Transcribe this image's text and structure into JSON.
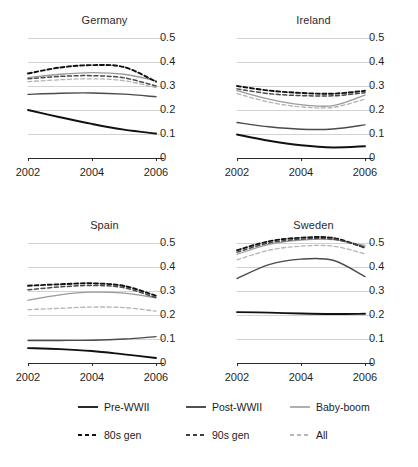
{
  "chart_data": {
    "type": "line",
    "title": "",
    "layout": {
      "rows": 2,
      "cols": 2,
      "shared_axes": true,
      "grid": true,
      "y_axis_side": "right",
      "legend_position": "bottom"
    },
    "x": [
      2002,
      2003,
      2004,
      2005,
      2006
    ],
    "xlabel": "",
    "ylabel": "",
    "xlim": [
      2002,
      2006
    ],
    "ylim": [
      0,
      0.5
    ],
    "xticks": [
      "2002",
      "2004",
      "2006"
    ],
    "xtick_values": [
      2002,
      2004,
      2006
    ],
    "yticks": [
      "0",
      "0.1",
      "0.2",
      "0.3",
      "0.4",
      "0.5"
    ],
    "ytick_values": [
      0,
      0.1,
      0.2,
      0.3,
      0.4,
      0.5
    ],
    "series_styles": [
      {
        "name": "Pre-WWII",
        "dash": "solid",
        "color": "#111111",
        "width": 1.9
      },
      {
        "name": "Post-WWII",
        "dash": "solid",
        "color": "#4a4a4a",
        "width": 1.4
      },
      {
        "name": "Baby-boom",
        "dash": "solid",
        "color": "#9a9a9a",
        "width": 1.3
      },
      {
        "name": "80s gen",
        "dash": "dashed",
        "color": "#111111",
        "width": 1.9
      },
      {
        "name": "90s gen",
        "dash": "dashed",
        "color": "#4a4a4a",
        "width": 1.5
      },
      {
        "name": "All",
        "dash": "dashed",
        "color": "#b4b4b4",
        "width": 1.3
      }
    ],
    "panels": [
      {
        "title": "Germany",
        "series": [
          {
            "name": "Pre-WWII",
            "values": [
              0.2,
              0.17,
              0.142,
              0.118,
              0.102
            ]
          },
          {
            "name": "Post-WWII",
            "values": [
              0.265,
              0.27,
              0.271,
              0.266,
              0.255
            ]
          },
          {
            "name": "Baby-boom",
            "values": [
              0.335,
              0.349,
              0.356,
              0.349,
              0.322
            ]
          },
          {
            "name": "80s gen",
            "values": [
              0.352,
              0.377,
              0.387,
              0.379,
              0.318
            ]
          },
          {
            "name": "90s gen",
            "values": [
              0.33,
              0.34,
              0.343,
              0.334,
              0.3
            ]
          },
          {
            "name": "All",
            "values": [
              0.318,
              0.326,
              0.33,
              0.322,
              0.293
            ]
          }
        ]
      },
      {
        "title": "Ireland",
        "series": [
          {
            "name": "Pre-WWII",
            "values": [
              0.098,
              0.072,
              0.053,
              0.044,
              0.049
            ]
          },
          {
            "name": "Post-WWII",
            "values": [
              0.148,
              0.13,
              0.12,
              0.121,
              0.138
            ]
          },
          {
            "name": "Baby-boom",
            "values": [
              0.281,
              0.245,
              0.222,
              0.218,
              0.262
            ]
          },
          {
            "name": "80s gen",
            "values": [
              0.3,
              0.281,
              0.271,
              0.268,
              0.28
            ]
          },
          {
            "name": "90s gen",
            "values": [
              0.288,
              0.268,
              0.26,
              0.259,
              0.272
            ]
          },
          {
            "name": "All",
            "values": [
              0.268,
              0.233,
              0.213,
              0.211,
              0.245
            ]
          }
        ]
      },
      {
        "title": "Spain",
        "series": [
          {
            "name": "Pre-WWII",
            "values": [
              0.062,
              0.058,
              0.05,
              0.036,
              0.021
            ]
          },
          {
            "name": "Post-WWII",
            "values": [
              0.094,
              0.094,
              0.095,
              0.1,
              0.11
            ]
          },
          {
            "name": "Baby-boom",
            "values": [
              0.262,
              0.284,
              0.295,
              0.291,
              0.272
            ]
          },
          {
            "name": "80s gen",
            "values": [
              0.322,
              0.328,
              0.332,
              0.321,
              0.28
            ]
          },
          {
            "name": "90s gen",
            "values": [
              0.305,
              0.317,
              0.323,
              0.314,
              0.272
            ]
          },
          {
            "name": "All",
            "values": [
              0.222,
              0.228,
              0.233,
              0.231,
              0.216
            ]
          }
        ]
      },
      {
        "title": "Sweden",
        "series": [
          {
            "name": "Pre-WWII",
            "values": [
              0.212,
              0.21,
              0.206,
              0.204,
              0.205
            ]
          },
          {
            "name": "Post-WWII",
            "values": [
              0.352,
              0.41,
              0.433,
              0.428,
              0.36
            ]
          },
          {
            "name": "Baby-boom",
            "values": [
              0.453,
              0.494,
              0.512,
              0.514,
              0.489
            ]
          },
          {
            "name": "80s gen",
            "values": [
              0.47,
              0.507,
              0.522,
              0.521,
              0.48
            ]
          },
          {
            "name": "90s gen",
            "values": [
              0.462,
              0.5,
              0.516,
              0.516,
              0.482
            ]
          },
          {
            "name": "All",
            "values": [
              0.43,
              0.47,
              0.487,
              0.487,
              0.455
            ]
          }
        ]
      }
    ]
  },
  "legend": {
    "rows": [
      [
        {
          "label": "Pre-WWII",
          "style": "solid",
          "color": "#111111"
        },
        {
          "label": "Post-WWII",
          "style": "solid",
          "color": "#3d3d3d"
        },
        {
          "label": "Baby-boom",
          "style": "solid",
          "color": "#a8a8a8"
        }
      ],
      [
        {
          "label": "80s gen",
          "style": "dashed",
          "color": "#111111"
        },
        {
          "label": "90s gen",
          "style": "dashed",
          "color": "#3d3d3d"
        },
        {
          "label": "All",
          "style": "dashed",
          "color": "#b8b8b8"
        }
      ]
    ]
  },
  "footnote": ""
}
